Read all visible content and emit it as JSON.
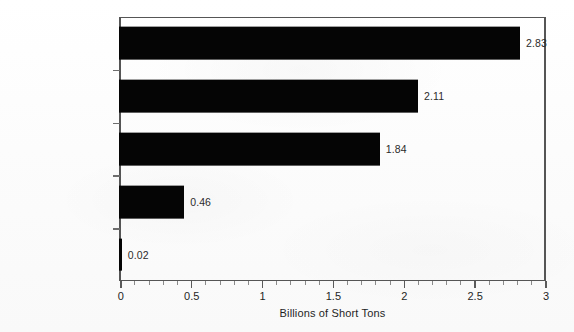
{
  "chart_data": {
    "type": "bar",
    "orientation": "horizontal",
    "title": "",
    "subtitle": "",
    "xlabel": "Billions of Short Tons",
    "ylabel": "",
    "xlim": [
      0,
      3
    ],
    "grid": false,
    "legend": null,
    "categories": [
      "British Columbia",
      "Alberta",
      "Saskatchewan",
      "Nova Scotia",
      "New Brunswick"
    ],
    "values": [
      2.83,
      2.11,
      1.84,
      0.46,
      0.02
    ],
    "data_labels": [
      "2.83",
      "2.11",
      "1.84",
      "0.46",
      "0.02"
    ],
    "emphasis": [
      true,
      true,
      true,
      false,
      false
    ],
    "bar_color": "#050505",
    "xticks": [
      0,
      0.5,
      1,
      1.5,
      2,
      2.5,
      3
    ],
    "xtick_labels": [
      "0",
      "0.5",
      "1",
      "1.5",
      "2",
      "2.5",
      "3"
    ],
    "minor_tick_interval": 0.1
  },
  "axis": {
    "title": "Billions of Short Tons"
  },
  "bars": [
    {
      "label": "British Columbia",
      "value_text": "2.83"
    },
    {
      "label": "Alberta",
      "value_text": "2.11"
    },
    {
      "label": "Saskatchewan",
      "value_text": "1.84"
    },
    {
      "label": "Nova Scotia",
      "value_text": "0.46"
    },
    {
      "label": "New Brunswick",
      "value_text": "0.02"
    }
  ]
}
